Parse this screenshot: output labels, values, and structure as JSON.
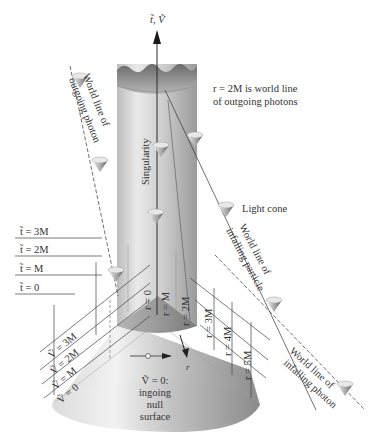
{
  "figure": {
    "axis_label": "t̃, Ṽ",
    "singularity_label": "Singularity",
    "r2m_caption_line1": "r = 2M is world line",
    "r2m_caption_line2": "of outgoing photons",
    "light_cone_label": "Light cone",
    "outgoing_photon_line1": "World line of",
    "outgoing_photon_line2": "outgoing photon",
    "infalling_particle_line1": "World line of",
    "infalling_particle_line2": "infalling particle",
    "infalling_photon_line1": "World line of",
    "infalling_photon_line2": "infalling photon",
    "null_surface_line1": "Ṽ = 0:",
    "null_surface_line2": "ingoing",
    "null_surface_line3": "null",
    "null_surface_line4": "surface",
    "r_axis_label": "r",
    "t_slices": [
      "t̃ = 3M",
      "t̃ = 2M",
      "t̃ = M",
      "t̃ = 0"
    ],
    "v_slices": [
      "Ṽ = 3M",
      "Ṽ = 2M",
      "Ṽ = M",
      "Ṽ = 0"
    ],
    "r_labels": [
      "r = 0",
      "r = M",
      "r = 2M",
      "r = 3M",
      "r = 4M",
      "r = 5M"
    ]
  },
  "colors": {
    "cylinder_light": "#e6e6e6",
    "cylinder_dark": "#9a9a9a",
    "cone_light": "#f0f0f0",
    "cone_dark": "#8c8c8c",
    "line": "#3a3a3a",
    "text": "#333333"
  }
}
